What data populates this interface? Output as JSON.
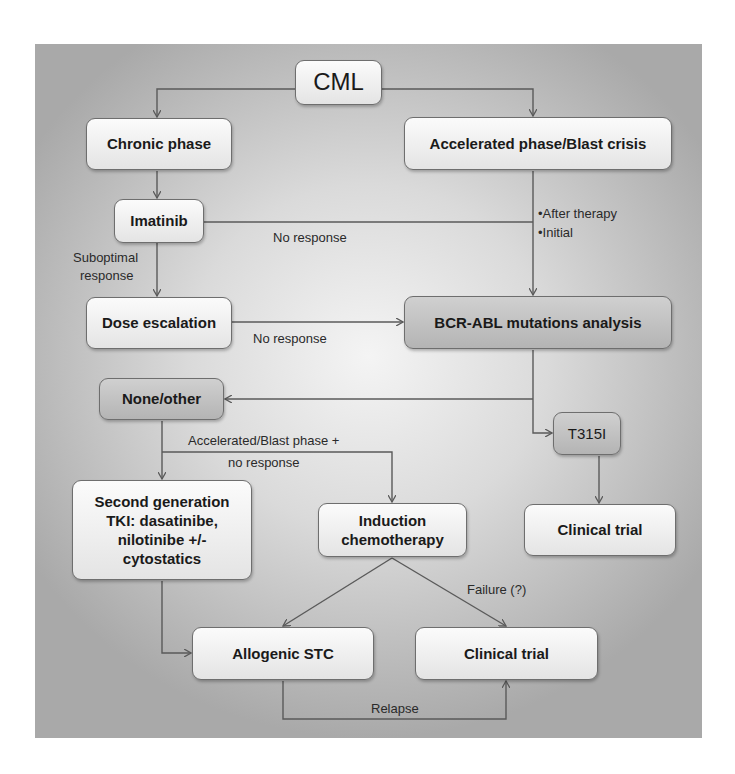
{
  "diagram": {
    "title": "CML",
    "nodes": {
      "cml": "CML",
      "chronic_phase": "Chronic phase",
      "accelerated_blast": "Accelerated phase/Blast crisis",
      "imatinib": "Imatinib",
      "dose_escalation": "Dose escalation",
      "bcr_abl": "BCR-ABL mutations analysis",
      "none_other": "None/other",
      "t315i": "T315I",
      "second_gen_tki": "Second generation TKI: dasatinibe, nilotinibe +/- cytostatics",
      "induction_chemo": "Induction chemotherapy",
      "clinical_trial_right": "Clinical trial",
      "allogenic_stc": "Allogenic STC",
      "clinical_trial_bottom": "Clinical trial"
    },
    "edge_labels": {
      "imatinib_no_response": "No response",
      "after_therapy": "•After therapy",
      "initial": "•Initial",
      "suboptimal_1": "Suboptimal",
      "suboptimal_2": "response",
      "dose_no_response": "No response",
      "accel_blast_1": "Accelerated/Blast phase +",
      "accel_blast_2": "no response",
      "failure": "Failure (?)",
      "relapse": "Relapse"
    },
    "second_gen_lines": [
      "Second generation",
      "TKI: dasatinibe,",
      "nilotinibe +/-",
      "cytostatics"
    ],
    "induction_lines": [
      "Induction",
      "chemotherapy"
    ],
    "colors": {
      "panel_center": "#f4f4f4",
      "panel_edge": "#a9a9a9",
      "node_light": "#eeeeee",
      "node_dark": "#c0c0c0",
      "line": "#5a5a5a"
    }
  }
}
